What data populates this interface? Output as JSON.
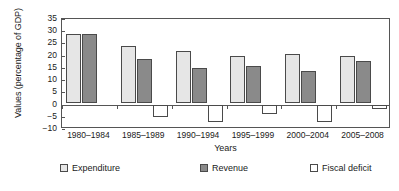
{
  "chart_data": {
    "type": "bar",
    "title": "",
    "xlabel": "Years",
    "ylabel": "Values (percentage of GDP)",
    "categories": [
      "1980–1984",
      "1985–1989",
      "1990–1994",
      "1995–1999",
      "2000–2004",
      "2005–2008"
    ],
    "series": [
      {
        "name": "Expenditure",
        "color": "#e6e6e6",
        "values": [
          28,
          23,
          21,
          19,
          20,
          19
        ]
      },
      {
        "name": "Revenue",
        "color": "#8a8a8a",
        "values": [
          28,
          18,
          14,
          15,
          13,
          17
        ]
      },
      {
        "name": "Fiscal deficit",
        "color": "#ffffff",
        "values": [
          0,
          -5,
          -7,
          -4,
          -7,
          -2
        ]
      }
    ],
    "ylim": [
      -10,
      35
    ],
    "yticks": [
      35,
      30,
      25,
      20,
      15,
      10,
      5,
      0,
      -5,
      -10
    ],
    "ytick_labels": [
      "35",
      "30",
      "25",
      "20",
      "15",
      "10",
      "5",
      "0",
      "−5",
      "−10"
    ],
    "grid": false,
    "legend_position": "bottom"
  }
}
